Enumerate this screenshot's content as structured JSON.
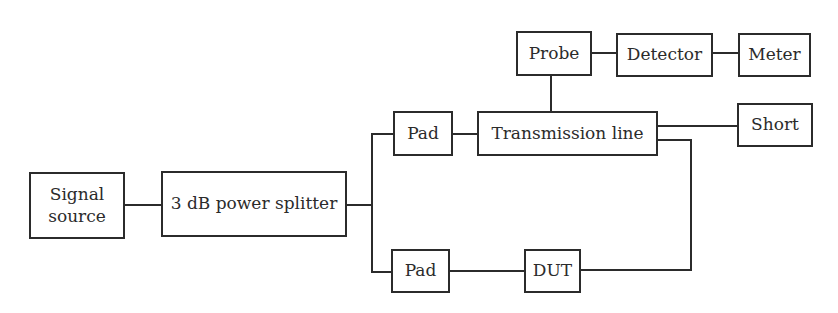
{
  "diagram": {
    "type": "block-diagram",
    "blocks": {
      "signal_source": "Signal\nsource",
      "power_splitter": "3 dB power splitter",
      "pad_top": "Pad",
      "transmission_line": "Transmission line",
      "probe": "Probe",
      "detector": "Detector",
      "meter": "Meter",
      "short": "Short",
      "pad_bottom": "Pad",
      "dut": "DUT"
    },
    "connections": [
      [
        "Signal source",
        "3 dB power splitter"
      ],
      [
        "3 dB power splitter",
        "Pad (top)"
      ],
      [
        "3 dB power splitter",
        "Pad (bottom)"
      ],
      [
        "Pad (top)",
        "Transmission line"
      ],
      [
        "Transmission line",
        "Probe"
      ],
      [
        "Probe",
        "Detector"
      ],
      [
        "Detector",
        "Meter"
      ],
      [
        "Transmission line",
        "Short"
      ],
      [
        "Pad (bottom)",
        "DUT"
      ],
      [
        "DUT",
        "Transmission line"
      ]
    ],
    "line_color": "#2b2b2b",
    "background": "#ffffff"
  }
}
